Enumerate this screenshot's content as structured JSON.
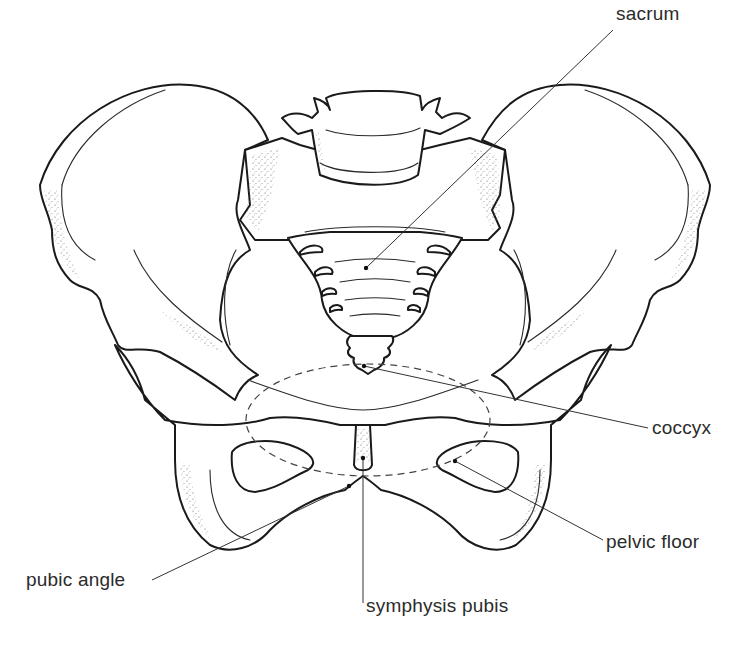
{
  "figure": {
    "labels": [
      {
        "id": "sacrum",
        "text": "sacrum"
      },
      {
        "id": "coccyx",
        "text": "coccyx"
      },
      {
        "id": "pelvic-floor",
        "text": "pelvic floor"
      },
      {
        "id": "pubic-angle",
        "text": "pubic angle"
      },
      {
        "id": "symphysis-pubis",
        "text": "symphysis pubis"
      }
    ]
  },
  "colors": {
    "background": "#ffffff",
    "line": "#1a1a1a",
    "label_text": "#2b2b2b"
  }
}
